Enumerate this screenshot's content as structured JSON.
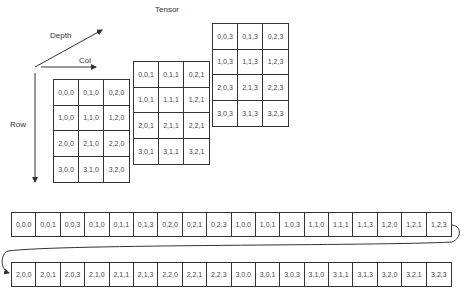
{
  "title": "Tensor",
  "axes": {
    "depth_label": "Depth",
    "col_label": "Col",
    "row_label": "Row"
  },
  "tensor_slices": [
    {
      "depth": 0,
      "cells": [
        "0,0,0",
        "0,1,0",
        "0,2,0",
        "1,0,0",
        "1,1,0",
        "1,2,0",
        "2,0,0",
        "2,1,0",
        "2,2,0",
        "3,0,0",
        "3,1,0",
        "3,2,0"
      ]
    },
    {
      "depth": 1,
      "cells": [
        "0,0,1",
        "0,1,1",
        "0,2,1",
        "1,0,1",
        "1,1,1",
        "1,2,1",
        "2,0,1",
        "2,1,1",
        "2,2,1",
        "3,0,1",
        "3,1,1",
        "3,2,1"
      ]
    },
    {
      "depth": 3,
      "cells": [
        "0,0,3",
        "0,1,3",
        "0,2,3",
        "1,0,3",
        "1,1,3",
        "1,2,3",
        "2,0,3",
        "2,1,3",
        "2,2,3",
        "3,0,3",
        "3,1,3",
        "3,2,3"
      ]
    }
  ],
  "linear_layout": {
    "row1": [
      "0,0,0",
      "0,0,1",
      "0,0,3",
      "0,1,0",
      "0,1,1",
      "0,1,3",
      "0,2,0",
      "0,2,1",
      "0,2,3",
      "1,0,0",
      "1,0,1",
      "1,0,3",
      "1,1,0",
      "1,1,1",
      "1,1,3",
      "1,2,0",
      "1,2,1",
      "1,2,3"
    ],
    "row2": [
      "2,0,0",
      "2,0,1",
      "2,0,3",
      "2,1,0",
      "2,1,1",
      "2,1,3",
      "2,2,0",
      "2,2,1",
      "2,2,3",
      "3,0,0",
      "3,0,1",
      "3,0,3",
      "3,1,0",
      "3,1,1",
      "3,1,3",
      "3,2,0",
      "3,2,1",
      "3,2,3"
    ]
  },
  "colors": {
    "line": "#333333",
    "text": "#444444",
    "background": "#ffffff"
  }
}
